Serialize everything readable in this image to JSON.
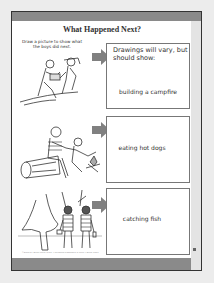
{
  "worksheet": {
    "title": "What Happened Next?",
    "instructions": "Draw a picture to show what the boys did next.",
    "answer_note": "Drawings will vary, but should show:",
    "panels": [
      {
        "illustration": "boys-gathering-wood-icon",
        "answer": "building a campfire"
      },
      {
        "illustration": "boys-roasting-hot-dogs-icon",
        "answer": "eating hot dogs"
      },
      {
        "illustration": "boys-walking-to-woods-icon",
        "answer": "catching fish"
      }
    ],
    "footer": "©2008 by Evan-Moor Corp. • Reading Passages & More • EMC 3371"
  },
  "colors": {
    "band": "#8a8a8a",
    "arrow": "#808080",
    "border": "#777777",
    "background": "#ececec"
  }
}
